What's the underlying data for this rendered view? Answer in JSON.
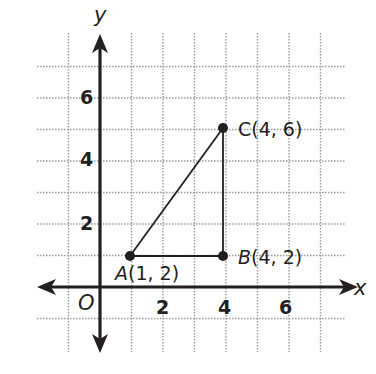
{
  "diagram": {
    "type": "coordinate-plane",
    "axes": {
      "x_label": "x",
      "y_label": "y",
      "origin_label": "O",
      "x_ticks": [
        "2",
        "4",
        "6"
      ],
      "y_ticks": [
        "2",
        "4",
        "6"
      ]
    },
    "points": [
      {
        "name": "A",
        "coords_text": "(1, 2)"
      },
      {
        "name": "B",
        "coords_text": "(4, 2)"
      },
      {
        "name": "C",
        "coords_text": "(4, 6)"
      }
    ],
    "segments": [
      "AB",
      "BC",
      "CA"
    ],
    "colors": {
      "ink": "#231f20",
      "grid": "#9a9a9a",
      "background": "#ffffff"
    }
  }
}
